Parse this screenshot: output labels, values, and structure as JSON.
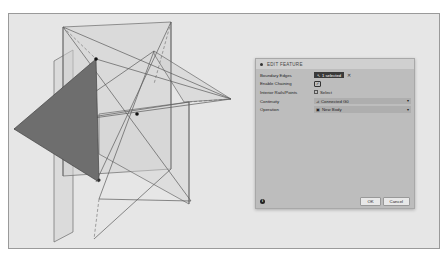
{
  "dialog": {
    "title": "EDIT FEATURE",
    "rows": [
      {
        "label": "Boundary Edges",
        "type": "selection",
        "value": "1 selected",
        "clear_icon": "close-icon"
      },
      {
        "label": "Enable Chaining",
        "type": "checkbox",
        "checked": true,
        "check_glyph": "✓"
      },
      {
        "label": "Interior Rails/Points",
        "type": "select-button",
        "value": "Select"
      },
      {
        "label": "Continuity",
        "type": "dropdown",
        "value": "Connected G0",
        "icon": "continuity-icon"
      },
      {
        "label": "Operation",
        "type": "dropdown",
        "value": "New Body",
        "icon": "new-body-icon"
      }
    ],
    "footer": {
      "info_glyph": "i",
      "ok_label": "OK",
      "cancel_label": "Cancel"
    }
  },
  "glyphs": {
    "arrow": "↖",
    "close": "✕",
    "caret": "▾",
    "continuity": "⊿",
    "new_body": "▣"
  },
  "colors": {
    "viewport_bg": "#e6e6e6",
    "face_light": "#cfcfcf",
    "face_selected": "#6e6e6e",
    "edge": "#5a5a5a",
    "dialog_bg": "#bdbdbd"
  }
}
